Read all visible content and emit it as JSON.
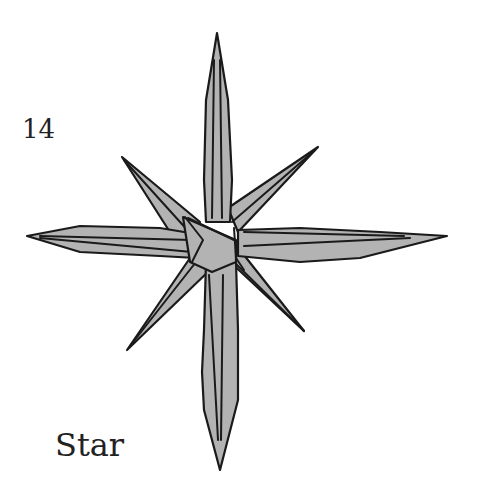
{
  "step": {
    "number": "14"
  },
  "caption": {
    "title": "Star"
  },
  "figure": {
    "fill_color": "#b3b3b3",
    "line_color": "#1a1a1a"
  }
}
